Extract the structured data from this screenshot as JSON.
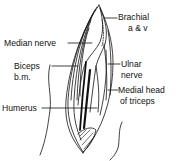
{
  "figure": {
    "labels": {
      "brachial_line1": "Brachial",
      "brachial_line2": "a & v",
      "median_nerve": "Median nerve",
      "biceps_line1": "Biceps",
      "biceps_line2": "b.m.",
      "ulnar_line1": "Ulnar",
      "ulnar_line2": "nerve",
      "triceps_line1": "Medial head",
      "triceps_line2": "of triceps",
      "humerus": "Humerus"
    },
    "colors": {
      "ink": "#111111",
      "background": "#ffffff"
    }
  }
}
